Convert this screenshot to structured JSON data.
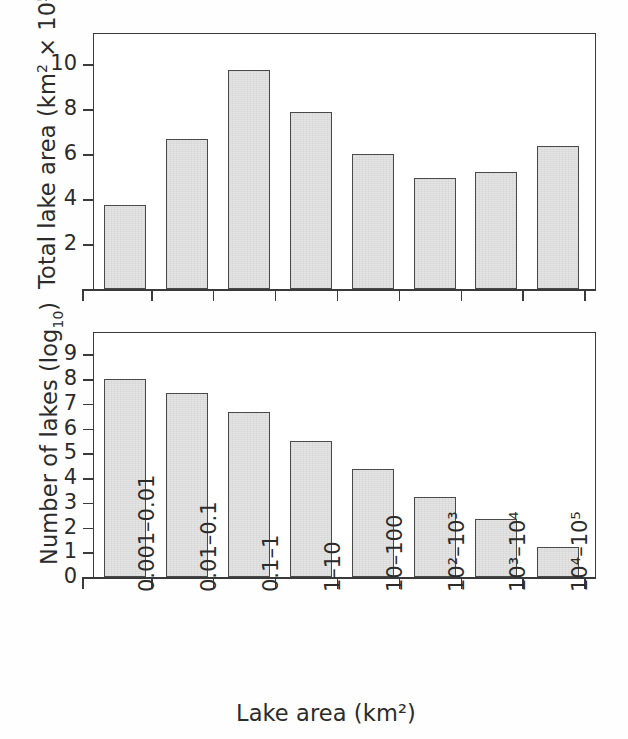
{
  "figure": {
    "background_color": "#fefefe",
    "bar_fill_color": "#e4e4e4",
    "bar_edge_color": "#4a4a4a",
    "axis_color": "#3a3a3a",
    "xlabel": "Lake area (km²)",
    "xtick_labels": [
      "0.001–0.01",
      "0.01–0.1",
      "0.1–1",
      "1–10",
      "10–100",
      "10²–10³",
      "10³–10⁴",
      "10⁴–10⁵"
    ]
  },
  "chart_data": [
    {
      "type": "bar",
      "title": "",
      "panel": "top",
      "xlabel": "Lake area (km²)",
      "ylabel": "Total lake area (km² × 10⁵)",
      "categories": [
        "0.001–0.01",
        "0.01–0.1",
        "0.1–1",
        "1–10",
        "10–100",
        "10²–10³",
        "10³–10⁴",
        "10⁴–10⁵"
      ],
      "values": [
        3.75,
        6.7,
        9.75,
        7.9,
        6.0,
        4.95,
        5.2,
        6.35
      ],
      "ytick_values": [
        2,
        4,
        6,
        8,
        10
      ],
      "ytick_labels": [
        "2",
        "4",
        "6",
        "8",
        "10"
      ],
      "ylim": [
        0,
        11.4
      ],
      "grid": false,
      "legend": "none"
    },
    {
      "type": "bar",
      "title": "",
      "panel": "bottom",
      "xlabel": "Lake area (km²)",
      "ylabel": "Number of lakes (log₁₀)",
      "categories": [
        "0.001–0.01",
        "0.01–0.1",
        "0.1–1",
        "1–10",
        "10–100",
        "10²–10³",
        "10³–10⁴",
        "10⁴–10⁵"
      ],
      "values": [
        8.0,
        7.45,
        6.65,
        5.5,
        4.35,
        3.25,
        2.35,
        1.2
      ],
      "ytick_values": [
        0,
        1,
        2,
        3,
        4,
        5,
        6,
        7,
        8,
        9
      ],
      "ytick_labels": [
        "0",
        "1",
        "2",
        "3",
        "4",
        "5",
        "6",
        "7",
        "8",
        "9"
      ],
      "ylim": [
        0,
        9.9
      ],
      "grid": false,
      "legend": "none"
    }
  ]
}
